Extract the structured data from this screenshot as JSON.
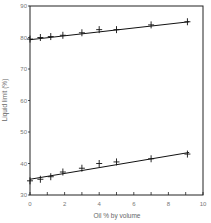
{
  "chart_data": {
    "type": "scatter",
    "title": "",
    "xlabel": "Oil % by volume",
    "ylabel": "Liquid limit (%)",
    "xlim": [
      0,
      10
    ],
    "ylim": [
      30,
      90
    ],
    "x_ticks": [
      "0",
      "2",
      "4",
      "6",
      "8",
      "10"
    ],
    "y_ticks": [
      "30",
      "40",
      "50",
      "60",
      "70",
      "80",
      "90"
    ],
    "grid": false,
    "legend": null,
    "series": [
      {
        "name": "upper",
        "marker": "+",
        "trendline": true,
        "x": [
          0,
          0.6,
          1.2,
          1.9,
          3.0,
          4.0,
          5.0,
          7.0,
          9.1
        ],
        "y": [
          79.5,
          80.0,
          80.3,
          80.7,
          81.5,
          82.5,
          82.5,
          84.0,
          85.0
        ],
        "fit": [
          [
            0,
            79.3
          ],
          [
            9.2,
            85.0
          ]
        ]
      },
      {
        "name": "lower",
        "marker": "+",
        "trendline": true,
        "x": [
          0,
          0.6,
          1.2,
          1.9,
          3.0,
          4.0,
          5.0,
          7.0,
          9.1
        ],
        "y": [
          34.5,
          35.0,
          35.8,
          37.3,
          38.5,
          40.0,
          40.5,
          41.5,
          43.0
        ],
        "fit": [
          [
            0,
            35.0
          ],
          [
            9.2,
            43.5
          ]
        ]
      }
    ]
  }
}
